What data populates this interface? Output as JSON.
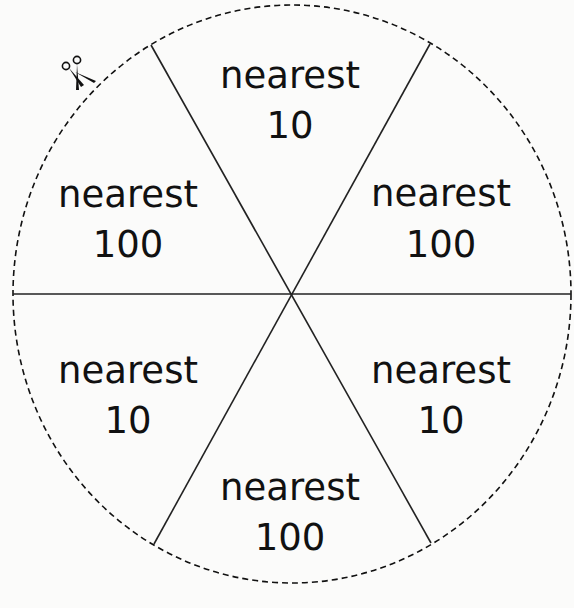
{
  "spinner": {
    "title": "",
    "outline": "dashed circle",
    "divisions": 6,
    "sections": [
      {
        "position": "top",
        "line1": "nearest",
        "line2": "10"
      },
      {
        "position": "upper-right",
        "line1": "nearest",
        "line2": "100"
      },
      {
        "position": "lower-right",
        "line1": "nearest",
        "line2": "10"
      },
      {
        "position": "bottom",
        "line1": "nearest",
        "line2": "100"
      },
      {
        "position": "lower-left",
        "line1": "nearest",
        "line2": "10"
      },
      {
        "position": "upper-left",
        "line1": "nearest",
        "line2": "100"
      }
    ],
    "cut_icon": "scissors-icon",
    "colors": {
      "ink": "#111111",
      "background": "#fbfbfa"
    }
  }
}
